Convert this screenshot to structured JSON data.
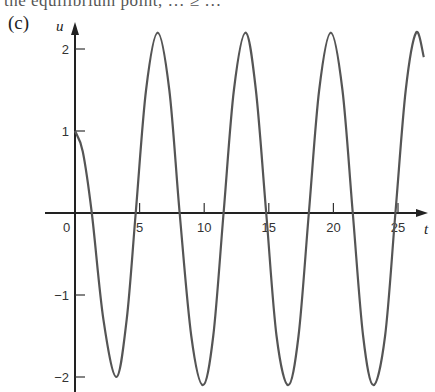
{
  "header": {
    "cutoff_text": "the equilibrium point, … ≥ …",
    "panel_label": "(c)"
  },
  "chart_data": {
    "type": "line",
    "title": "",
    "panel": "(c)",
    "xlabel": "t",
    "ylabel": "u",
    "xlim": [
      0,
      27
    ],
    "ylim": [
      -2.2,
      2.3
    ],
    "xticks": [
      0,
      5,
      10,
      15,
      20,
      25
    ],
    "yticks": [
      -2,
      -1,
      1,
      2
    ],
    "xtick_labels": [
      "0",
      "5",
      "10",
      "15",
      "20",
      "25"
    ],
    "ytick_labels": [
      "−2",
      "−1",
      "1",
      "2"
    ],
    "grid": false,
    "legend": null,
    "series": [
      {
        "name": "u(t)",
        "color": "#555555",
        "x": [
          0,
          0.6,
          1.3,
          2.2,
          3.2,
          4.0,
          4.7,
          5.5,
          6.4,
          7.3,
          8.1,
          9.0,
          9.9,
          10.7,
          11.5,
          12.3,
          13.2,
          14.0,
          14.8,
          15.6,
          16.5,
          17.3,
          18.1,
          18.9,
          19.8,
          20.7,
          21.5,
          22.3,
          23.1,
          24.0,
          24.8,
          25.6,
          26.4,
          27.0
        ],
        "y": [
          1.0,
          0.75,
          0.0,
          -1.3,
          -2.0,
          -1.3,
          0.0,
          1.5,
          2.2,
          1.5,
          0.0,
          -1.5,
          -2.1,
          -1.5,
          0.0,
          1.5,
          2.2,
          1.5,
          0.0,
          -1.5,
          -2.1,
          -1.5,
          0.0,
          1.5,
          2.2,
          1.5,
          0.0,
          -1.5,
          -2.1,
          -1.5,
          0.0,
          1.5,
          2.2,
          1.9
        ]
      }
    ],
    "annotations": []
  },
  "axes": {
    "x_label": "t",
    "y_label": "u"
  }
}
